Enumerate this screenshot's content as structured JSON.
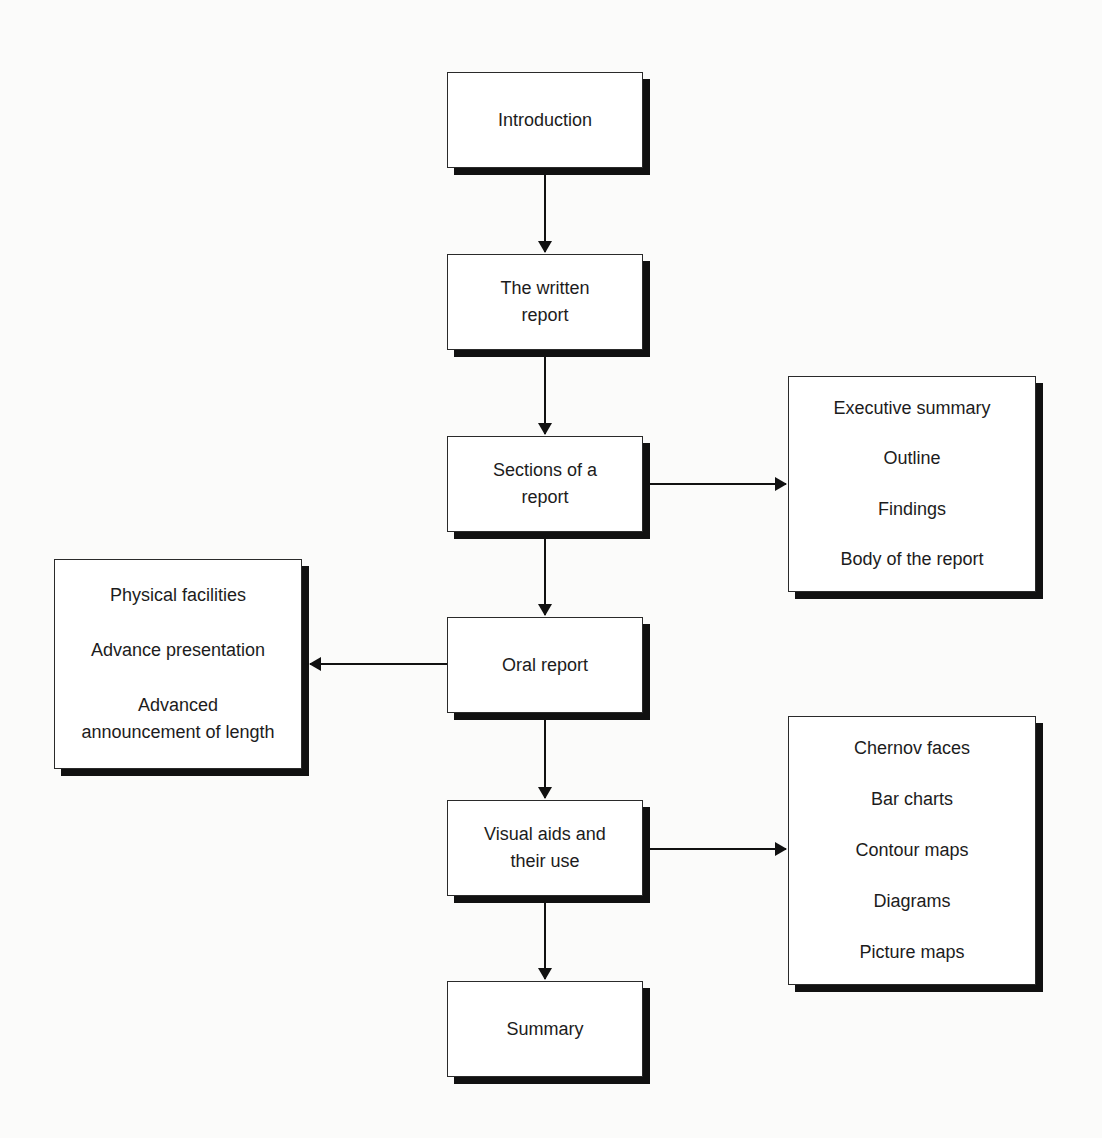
{
  "diagram": {
    "main_flow": [
      {
        "id": "introduction",
        "label": "Introduction"
      },
      {
        "id": "written-report",
        "label": "The written report"
      },
      {
        "id": "sections",
        "label": "Sections of a report"
      },
      {
        "id": "oral-report",
        "label": "Oral report"
      },
      {
        "id": "visual-aids",
        "label": "Visual aids and their use"
      },
      {
        "id": "summary",
        "label": "Summary"
      }
    ],
    "sections_details": {
      "items": [
        "Executive summary",
        "Outline",
        "Findings",
        "Body of the report"
      ]
    },
    "oral_details": {
      "items": [
        "Physical facilities",
        "Advance presentation",
        "Advanced announcement of length"
      ]
    },
    "visual_details": {
      "items": [
        "Chernov faces",
        "Bar charts",
        "Contour maps",
        "Diagrams",
        "Picture maps"
      ]
    },
    "colors": {
      "box_border": "#2a2a2a",
      "shadow": "#111111",
      "arrow": "#111111",
      "background": "#fbfbfa"
    }
  }
}
